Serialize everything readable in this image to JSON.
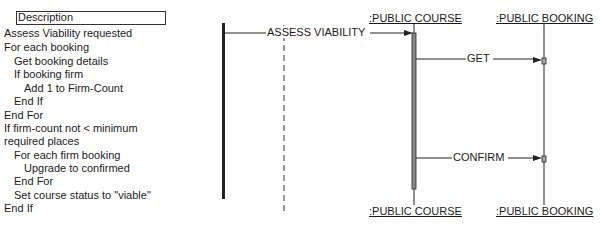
{
  "description": {
    "title": "Description",
    "lines": [
      {
        "text": "Assess Viability requested",
        "indent": 0
      },
      {
        "text": "For each booking",
        "indent": 0
      },
      {
        "text": "Get booking details",
        "indent": 1
      },
      {
        "text": "If booking firm",
        "indent": 1
      },
      {
        "text": "Add 1 to Firm-Count",
        "indent": 2
      },
      {
        "text": "End If",
        "indent": 1
      },
      {
        "text": "End For",
        "indent": 0
      },
      {
        "text": "If firm-count not < minimum",
        "indent": 0
      },
      {
        "text": "required places",
        "indent": 0
      },
      {
        "text": "For each firm booking",
        "indent": 1
      },
      {
        "text": "Upgrade to confirmed",
        "indent": 2
      },
      {
        "text": "End For",
        "indent": 1
      },
      {
        "text": "Set course status to \"viable\"",
        "indent": 1
      },
      {
        "text": "End If",
        "indent": 0
      }
    ]
  },
  "objects": {
    "course_top": ":PUBLIC COURSE",
    "booking_top": ":PUBLIC BOOKING",
    "course_bottom": ":PUBLIC COURSE",
    "booking_bottom": ":PUBLIC BOOKING"
  },
  "messages": {
    "assess": "ASSESS VIABILITY",
    "get": "GET",
    "confirm": "CONFIRM"
  },
  "colors": {
    "line": "#222222",
    "activation_fill": "#8a8a8a"
  }
}
